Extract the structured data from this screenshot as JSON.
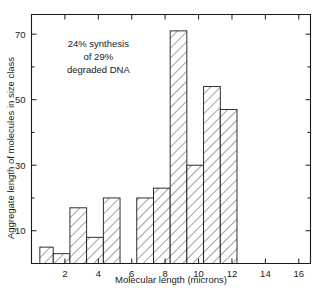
{
  "chart_data": {
    "type": "bar",
    "title": "",
    "xlabel": "Molecular length (microns)",
    "ylabel": "Aggregate length of molecules in size class",
    "xlim": [
      0,
      16.7
    ],
    "ylim": [
      0,
      76
    ],
    "grid": false,
    "legend": "none",
    "xticks": [
      2,
      4,
      6,
      8,
      10,
      12,
      14,
      16
    ],
    "xtick_labels": [
      "2",
      "4",
      "6",
      "8",
      "10",
      "12",
      "14",
      "16"
    ],
    "yticks": [
      10,
      30,
      50,
      70
    ],
    "ytick_labels": [
      "10",
      "30",
      "50",
      "70"
    ],
    "yminor_ticks": [
      20,
      40,
      60
    ],
    "bar_style": "hatched-diagonal",
    "bins": [
      {
        "x0": 0.5,
        "x1": 1.3,
        "value": 5
      },
      {
        "x0": 1.3,
        "x1": 2.3,
        "value": 3
      },
      {
        "x0": 2.3,
        "x1": 3.3,
        "value": 17
      },
      {
        "x0": 3.3,
        "x1": 4.3,
        "value": 8
      },
      {
        "x0": 4.3,
        "x1": 5.3,
        "value": 20
      },
      {
        "x0": 6.3,
        "x1": 7.3,
        "value": 20
      },
      {
        "x0": 7.3,
        "x1": 8.3,
        "value": 23
      },
      {
        "x0": 8.3,
        "x1": 9.3,
        "value": 71
      },
      {
        "x0": 9.3,
        "x1": 10.3,
        "value": 30
      },
      {
        "x0": 10.3,
        "x1": 11.3,
        "value": 54
      },
      {
        "x0": 11.3,
        "x1": 12.3,
        "value": 47
      }
    ],
    "annotations": [
      {
        "lines": [
          "24% synthesis",
          "of 29%",
          "degraded DNA"
        ],
        "x": 4.0,
        "y": 66
      }
    ]
  },
  "caption": {
    "text": ""
  },
  "colors": {
    "ink": "#1a1a1a",
    "background": "#ffffff",
    "bar_fill": "#ffffff",
    "hatch": "#5a5a5a"
  }
}
